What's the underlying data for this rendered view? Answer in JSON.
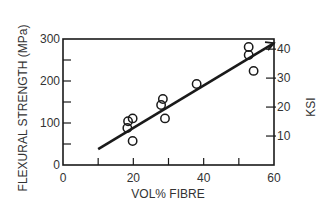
{
  "chart_data": {
    "type": "scatter",
    "title": "",
    "xlabel": "VOL% FIBRE",
    "ylabel": "FLEXURAL STRENGTH (MPa)",
    "y2label": "KSI",
    "xlim": [
      0,
      60
    ],
    "ylim": [
      0,
      300
    ],
    "y2lim": [
      0,
      43.5
    ],
    "x_ticks": [
      0,
      10,
      20,
      30,
      40,
      50,
      60
    ],
    "x_tick_labels": [
      "0",
      "20",
      "40",
      "60"
    ],
    "y_ticks": [
      0,
      50,
      100,
      150,
      200,
      250,
      300
    ],
    "y_tick_labels": [
      "0",
      "100",
      "200",
      "300"
    ],
    "y2_ticks": [
      10,
      20,
      30,
      40
    ],
    "y2_tick_labels": [
      "10",
      "20",
      "30",
      "40"
    ],
    "grid": false,
    "legend": null,
    "series": [
      {
        "name": "Measured data",
        "marker": "open-circle",
        "points": [
          {
            "x": 18.5,
            "y": 104
          },
          {
            "x": 19.8,
            "y": 111
          },
          {
            "x": 18.3,
            "y": 88
          },
          {
            "x": 19.8,
            "y": 57
          },
          {
            "x": 28.4,
            "y": 157
          },
          {
            "x": 27.9,
            "y": 143
          },
          {
            "x": 29.0,
            "y": 111
          },
          {
            "x": 38.0,
            "y": 193
          },
          {
            "x": 52.8,
            "y": 281
          },
          {
            "x": 52.8,
            "y": 262
          },
          {
            "x": 54.2,
            "y": 224
          }
        ]
      },
      {
        "name": "Linear fit",
        "type": "line",
        "points": [
          {
            "x": 10,
            "y": 38
          },
          {
            "x": 60,
            "y": 290
          }
        ]
      }
    ]
  },
  "labels": {
    "xlabel": "VOL% FIBRE",
    "ylabel": "FLEXURAL STRENGTH (MPa)",
    "y2label": "KSI",
    "x_tick_labels": [
      "0",
      "20",
      "40",
      "60"
    ],
    "y_tick_labels": [
      "0",
      "100",
      "200",
      "300"
    ],
    "y2_tick_labels": [
      "10",
      "20",
      "30",
      "40"
    ]
  }
}
